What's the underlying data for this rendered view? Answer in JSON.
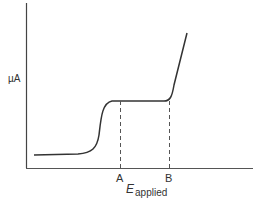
{
  "diagram": {
    "y_axis_label": "µA",
    "x_axis_label_main": "E",
    "x_axis_label_sub": "applied",
    "markers": [
      {
        "label": "A"
      },
      {
        "label": "B"
      }
    ],
    "line_color": "#333333"
  }
}
